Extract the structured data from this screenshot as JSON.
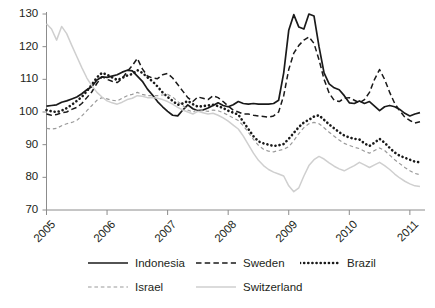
{
  "chart_data": {
    "type": "line",
    "title": "",
    "subtitle": "",
    "xlabel": "",
    "ylabel": "",
    "xlim": [
      2005.0,
      2011.25
    ],
    "ylim": [
      70,
      130
    ],
    "grid": false,
    "legend_position": "bottom",
    "x_tick_labels": [
      "2005",
      "2006",
      "2007",
      "2008",
      "2009",
      "2010",
      "2011"
    ],
    "x_tick_values": [
      2005,
      2006,
      2007,
      2008,
      2009,
      2010,
      2011
    ],
    "y_tick_labels": [
      "70",
      "80",
      "90",
      "100",
      "110",
      "120",
      "130"
    ],
    "y_tick_values": [
      70,
      80,
      90,
      100,
      110,
      120,
      130
    ],
    "x": [
      2005.0,
      2005.083,
      2005.167,
      2005.25,
      2005.333,
      2005.417,
      2005.5,
      2005.583,
      2005.667,
      2005.75,
      2005.833,
      2005.917,
      2006.0,
      2006.083,
      2006.167,
      2006.25,
      2006.333,
      2006.417,
      2006.5,
      2006.583,
      2006.667,
      2006.75,
      2006.833,
      2006.917,
      2007.0,
      2007.083,
      2007.167,
      2007.25,
      2007.333,
      2007.417,
      2007.5,
      2007.583,
      2007.667,
      2007.75,
      2007.833,
      2007.917,
      2008.0,
      2008.083,
      2008.167,
      2008.25,
      2008.333,
      2008.417,
      2008.5,
      2008.583,
      2008.667,
      2008.75,
      2008.833,
      2008.917,
      2009.0,
      2009.083,
      2009.167,
      2009.25,
      2009.333,
      2009.417,
      2009.5,
      2009.583,
      2009.667,
      2009.75,
      2009.833,
      2009.917,
      2010.0,
      2010.083,
      2010.167,
      2010.25,
      2010.333,
      2010.417,
      2010.5,
      2010.583,
      2010.667,
      2010.75,
      2010.833,
      2010.917,
      2011.0,
      2011.083,
      2011.167
    ],
    "series": [
      {
        "name": "Indonesia",
        "style": "solid",
        "color": "#1a1a1a",
        "width": 1.7,
        "values": [
          101.8,
          102.0,
          102.2,
          103.0,
          103.4,
          104.0,
          104.6,
          105.6,
          106.8,
          107.8,
          109.8,
          110.8,
          110.6,
          111.0,
          111.4,
          112.2,
          112.8,
          112.6,
          111.0,
          109.4,
          107.0,
          105.2,
          103.2,
          101.6,
          100.2,
          99.0,
          98.8,
          100.6,
          102.2,
          101.0,
          100.4,
          100.6,
          101.2,
          102.0,
          102.8,
          102.0,
          101.6,
          102.2,
          103.2,
          102.6,
          102.4,
          102.6,
          102.4,
          102.4,
          102.4,
          102.6,
          103.6,
          112.0,
          125.0,
          129.8,
          126.0,
          125.4,
          130.0,
          129.4,
          120.0,
          112.0,
          108.6,
          107.4,
          106.8,
          105.0,
          102.8,
          102.6,
          103.4,
          102.6,
          103.2,
          101.8,
          100.4,
          101.6,
          102.0,
          101.6,
          100.8,
          99.6,
          98.8,
          99.4,
          99.8
        ]
      },
      {
        "name": "Sweden",
        "style": "dashed",
        "color": "#1a1a1a",
        "width": 1.5,
        "values": [
          99.4,
          99.0,
          99.2,
          99.8,
          100.0,
          100.8,
          101.4,
          102.6,
          104.4,
          106.2,
          108.8,
          110.8,
          110.0,
          109.4,
          109.0,
          110.2,
          112.4,
          114.2,
          116.4,
          113.2,
          111.0,
          110.4,
          110.2,
          111.4,
          111.8,
          110.4,
          108.4,
          106.4,
          104.4,
          103.2,
          104.6,
          104.2,
          103.8,
          105.0,
          104.4,
          103.2,
          101.8,
          100.6,
          100.0,
          99.4,
          99.4,
          99.0,
          98.8,
          98.6,
          98.4,
          98.8,
          100.0,
          105.0,
          113.0,
          118.0,
          120.4,
          122.0,
          123.0,
          121.0,
          116.0,
          110.0,
          105.8,
          103.6,
          103.2,
          104.2,
          104.4,
          103.6,
          102.8,
          103.8,
          106.0,
          110.0,
          113.0,
          110.0,
          106.0,
          102.6,
          100.4,
          98.4,
          97.4,
          96.6,
          97.0
        ]
      },
      {
        "name": "Brazil",
        "style": "dotted",
        "color": "#1a1a1a",
        "width": 2.6,
        "values": [
          100.6,
          100.2,
          100.0,
          100.4,
          101.2,
          102.2,
          103.4,
          104.6,
          106.4,
          108.4,
          110.6,
          112.0,
          111.4,
          110.6,
          109.8,
          110.4,
          111.2,
          111.6,
          112.8,
          112.0,
          110.6,
          109.4,
          107.8,
          106.0,
          104.6,
          103.4,
          102.2,
          102.6,
          103.4,
          102.4,
          101.6,
          101.8,
          102.0,
          102.2,
          101.8,
          101.2,
          100.4,
          99.8,
          99.2,
          97.0,
          94.8,
          92.6,
          91.0,
          90.4,
          90.0,
          89.6,
          89.8,
          90.2,
          91.8,
          93.6,
          95.4,
          96.8,
          97.6,
          98.6,
          99.0,
          97.6,
          96.2,
          95.0,
          93.8,
          92.8,
          92.2,
          91.8,
          91.6,
          90.4,
          89.6,
          90.6,
          91.8,
          90.6,
          89.0,
          87.6,
          86.6,
          86.0,
          85.4,
          84.8,
          84.6
        ]
      },
      {
        "name": "Israel",
        "style": "dashed",
        "color": "#9a9a9a",
        "width": 1.2,
        "values": [
          95.0,
          94.8,
          95.0,
          95.8,
          96.4,
          96.8,
          97.4,
          98.8,
          100.4,
          102.0,
          103.6,
          104.4,
          104.0,
          103.6,
          103.4,
          104.2,
          105.0,
          105.4,
          106.0,
          105.4,
          105.0,
          105.0,
          105.0,
          105.2,
          105.4,
          104.6,
          103.2,
          102.0,
          100.6,
          100.0,
          100.8,
          100.4,
          100.2,
          100.6,
          100.4,
          99.8,
          99.0,
          98.2,
          97.4,
          95.8,
          93.8,
          91.6,
          89.8,
          88.6,
          88.0,
          87.8,
          88.2,
          88.6,
          89.4,
          91.2,
          93.4,
          95.2,
          96.4,
          96.8,
          96.4,
          95.2,
          93.8,
          92.6,
          91.4,
          90.4,
          89.8,
          89.2,
          88.8,
          88.0,
          87.4,
          88.2,
          89.0,
          88.2,
          86.8,
          85.4,
          84.2,
          83.0,
          82.0,
          81.2,
          80.8
        ]
      },
      {
        "name": "Switzerland",
        "style": "solid",
        "color": "#cfcfcf",
        "width": 1.5,
        "values": [
          127.0,
          125.4,
          122.0,
          126.2,
          124.0,
          120.4,
          117.0,
          113.6,
          110.4,
          108.0,
          106.0,
          104.6,
          103.4,
          102.8,
          102.4,
          103.0,
          103.8,
          104.2,
          105.0,
          104.8,
          104.4,
          104.4,
          104.2,
          103.8,
          103.2,
          102.4,
          101.4,
          100.6,
          100.0,
          99.4,
          100.2,
          99.8,
          99.4,
          99.6,
          99.0,
          98.2,
          97.2,
          96.0,
          94.8,
          92.6,
          90.0,
          87.4,
          85.2,
          83.6,
          82.4,
          81.6,
          81.0,
          80.4,
          77.4,
          75.6,
          76.8,
          80.4,
          83.6,
          85.4,
          86.4,
          85.6,
          84.4,
          83.4,
          82.6,
          82.0,
          82.8,
          83.6,
          84.6,
          83.8,
          83.0,
          83.8,
          84.6,
          83.6,
          82.4,
          81.0,
          79.8,
          78.8,
          78.0,
          77.4,
          77.2
        ]
      }
    ]
  },
  "legend": {
    "items": [
      {
        "label": "Indonesia",
        "key": "solid-line-black"
      },
      {
        "label": "Sweden",
        "key": "dashed-line-black"
      },
      {
        "label": "Brazil",
        "key": "dotted-line-black"
      },
      {
        "label": "Israel",
        "key": "dashed-line-gray"
      },
      {
        "label": "Switzerland",
        "key": "solid-line-lightgray"
      }
    ]
  },
  "axes": {
    "axis_color": "#8c8c8c",
    "tick_color": "#8c8c8c",
    "label_color": "#231f20"
  }
}
